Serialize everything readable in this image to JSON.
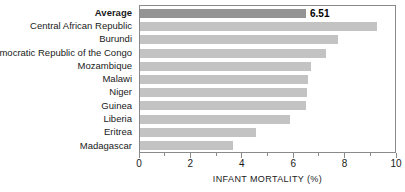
{
  "chart_data": {
    "type": "bar",
    "orientation": "horizontal",
    "title": "",
    "xlabel": "INFANT MORTALITY (%)",
    "ylabel": "",
    "xlim": [
      0,
      10
    ],
    "grid": false,
    "legend": null,
    "xticks": [
      0,
      2,
      4,
      6,
      8,
      10
    ],
    "xtick_labels": [
      "0",
      "2",
      "4",
      "6",
      "8",
      "10"
    ],
    "minor_xticks": [
      1,
      3,
      5,
      7,
      9
    ],
    "categories": [
      "Average",
      "Central African Republic",
      "Burundi",
      "Democratic Republic of the Congo",
      "Mozambique",
      "Malawi",
      "Niger",
      "Guinea",
      "Liberia",
      "Eritrea",
      "Madagascar"
    ],
    "values": [
      6.51,
      9.3,
      7.75,
      7.3,
      6.7,
      6.6,
      6.55,
      6.5,
      5.9,
      4.55,
      3.65
    ],
    "data_labels": [
      "6.51",
      "",
      "",
      "",
      "",
      "",
      "",
      "",
      "",
      "",
      ""
    ],
    "highlight_index": 0,
    "colors": {
      "bar": "#c3c3c3",
      "bar_highlight": "#949494",
      "frame": "#8a8a8a",
      "text": "#1a1a1a",
      "value_label": "#000000",
      "background": "#ffffff"
    }
  }
}
